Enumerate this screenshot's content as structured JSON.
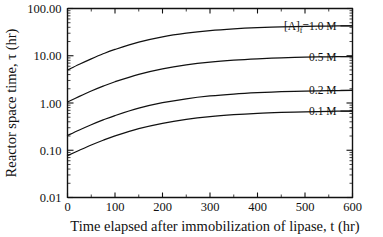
{
  "chart_data": {
    "type": "line",
    "title": "",
    "xlabel": "Time elapsed after immobilization of lipase, t  (hr)",
    "ylabel": "Reactor space time, τ  (hr)",
    "yscale": "log",
    "xlim": [
      0,
      600
    ],
    "ylim": [
      0.01,
      100.0
    ],
    "grid": false,
    "legend_position": "inline-right",
    "xticks": [
      "0",
      "100",
      "200",
      "300",
      "400",
      "500",
      "600"
    ],
    "xtick_values": [
      0,
      100,
      200,
      300,
      400,
      500,
      600
    ],
    "yticks": [
      "100.00",
      "10.00",
      "1.00",
      "0.10",
      "0.01"
    ],
    "ytick_values": [
      100.0,
      10.0,
      1.0,
      0.1,
      0.01
    ],
    "x": [
      0,
      25,
      50,
      75,
      100,
      150,
      200,
      250,
      300,
      350,
      400,
      450,
      500,
      550,
      600
    ],
    "series": [
      {
        "name": "[A]f=1.0 M",
        "label_main": "=1.0 M",
        "label_prefix": "[A]",
        "label_sub": "f",
        "values": [
          5.0,
          6.6,
          8.6,
          11.0,
          13.6,
          19.4,
          25.1,
          30.0,
          34.0,
          37.0,
          39.2,
          40.8,
          41.9,
          42.6,
          43.0
        ]
      },
      {
        "name": "0.5 M",
        "label_main": "0.5 M",
        "label_prefix": "",
        "label_sub": "",
        "values": [
          1.05,
          1.38,
          1.79,
          2.27,
          2.82,
          4.05,
          5.29,
          6.41,
          7.34,
          8.07,
          8.62,
          9.02,
          9.31,
          9.5,
          9.62
        ]
      },
      {
        "name": "0.2 M",
        "label_main": "0.2 M",
        "label_prefix": "",
        "label_sub": "",
        "values": [
          0.205,
          0.268,
          0.346,
          0.438,
          0.542,
          0.776,
          1.013,
          1.228,
          1.408,
          1.549,
          1.656,
          1.734,
          1.789,
          1.827,
          1.852
        ]
      },
      {
        "name": "0.1 M",
        "label_main": "0.1 M",
        "label_prefix": "",
        "label_sub": "",
        "values": [
          0.077,
          0.1,
          0.129,
          0.163,
          0.201,
          0.286,
          0.371,
          0.449,
          0.514,
          0.565,
          0.604,
          0.632,
          0.652,
          0.666,
          0.675
        ]
      }
    ],
    "label_anchors": [
      {
        "name": "[A]f=1.0 M",
        "x": 600,
        "y": 43.0
      },
      {
        "name": "0.5 M",
        "x": 600,
        "y": 9.62
      },
      {
        "name": "0.2 M",
        "x": 600,
        "y": 1.852
      },
      {
        "name": "0.1 M",
        "x": 600,
        "y": 0.675
      }
    ],
    "colors": {
      "curve": "#111111",
      "axis": "#111111",
      "background": "#ffffff"
    }
  }
}
